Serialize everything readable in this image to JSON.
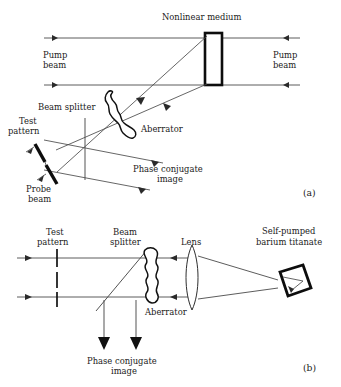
{
  "figure": {
    "background_color": "#ffffff",
    "ink_color": "#1a1a1a"
  },
  "panel_a": {
    "id": "a",
    "panel_label": "(a)",
    "labels": {
      "nonlinear_medium": "Nonlinear medium",
      "pump_beam_left": "Pump\nbeam",
      "pump_beam_left_line1": "Pump",
      "pump_beam_left_line2": "beam",
      "pump_beam_right_line1": "Pump",
      "pump_beam_right_line2": "beam",
      "beam_splitter": "Beam splitter",
      "test_pattern_line1": "Test",
      "test_pattern_line2": "pattern",
      "probe_beam_line1": "Probe",
      "probe_beam_line2": "beam",
      "aberrator": "Aberrator",
      "phase_conjugate_line1": "Phase conjugate",
      "phase_conjugate_line2": "image"
    },
    "components": [
      {
        "name": "nonlinear-medium",
        "shape": "rectangle",
        "x": 205,
        "y": 33,
        "width": 17,
        "height": 52
      },
      {
        "name": "beam-splitter",
        "shape": "vertical-line",
        "x": 85,
        "y_top": 120,
        "y_bottom": 180
      },
      {
        "name": "test-pattern",
        "shape": "tilted-bar"
      },
      {
        "name": "probe-beam-bar",
        "shape": "tilted-bar"
      },
      {
        "name": "aberrator",
        "shape": "irregular-blob"
      }
    ]
  },
  "panel_b": {
    "id": "b",
    "panel_label": "(b)",
    "labels": {
      "test_pattern_line1": "Test",
      "test_pattern_line2": "pattern",
      "beam_splitter_line1": "Beam",
      "beam_splitter_line2": "splitter",
      "lens": "Lens",
      "self_pumped_line1": "Self-pumped",
      "self_pumped_line2": "barium titanate",
      "aberrator": "Aberrator",
      "phase_conjugate_line1": "Phase conjugate",
      "phase_conjugate_line2": "image"
    },
    "components": [
      {
        "name": "test-pattern",
        "shape": "dashed-vertical-line",
        "x": 57
      },
      {
        "name": "beam-splitter",
        "shape": "diagonal-line"
      },
      {
        "name": "aberrator",
        "shape": "wavy-vertical-column",
        "x": 148
      },
      {
        "name": "lens",
        "shape": "biconvex-lens",
        "x": 192
      },
      {
        "name": "barium-titanate-crystal",
        "shape": "tilted-square",
        "x": 287,
        "y": 280
      }
    ]
  }
}
